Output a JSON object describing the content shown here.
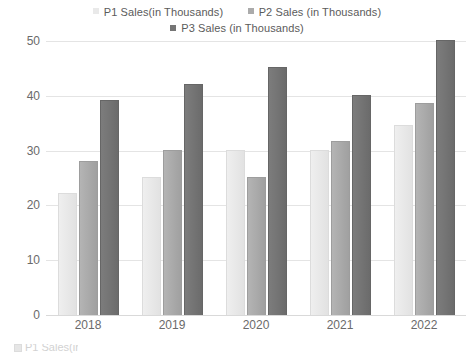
{
  "chart_data": {
    "type": "bar",
    "title": "",
    "xlabel": "",
    "ylabel": "",
    "categories": [
      "2018",
      "2019",
      "2020",
      "2021",
      "2022"
    ],
    "ylim": [
      0,
      50
    ],
    "yticks": [
      0,
      10,
      20,
      30,
      40,
      50
    ],
    "grid": true,
    "legend_position": "top",
    "series": [
      {
        "name": "P1 Sales(in Thousands)",
        "color": "#e9e9e9",
        "values": [
          22,
          25,
          30,
          30,
          34.5
        ]
      },
      {
        "name": "P2 Sales (in Thousands)",
        "color": "#ababab",
        "values": [
          28,
          30,
          25,
          31.5,
          38.5
        ]
      },
      {
        "name": "P3 Sales (in Thousands)",
        "color": "#757575",
        "values": [
          39,
          42,
          45,
          40,
          50
        ]
      }
    ]
  },
  "legend": {
    "rows": [
      [
        "P1 Sales(in Thousands)",
        "P2 Sales (in Thousands)"
      ],
      [
        "P3 Sales (in Thousands)"
      ]
    ]
  },
  "axis": {
    "y_tick_labels": [
      "50",
      "40",
      "30",
      "20",
      "10",
      "0"
    ],
    "x_tick_labels": [
      "2018",
      "2019",
      "2020",
      "2021",
      "2022"
    ]
  },
  "bottom_remnant": {
    "text": "P1 Sales(in"
  }
}
